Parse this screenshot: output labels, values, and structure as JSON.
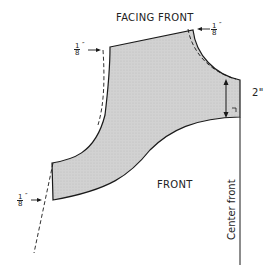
{
  "diagram": {
    "title": "FACING FRONT",
    "front_label": "FRONT",
    "center_front_label": "Center front",
    "measure_label": "2\"",
    "allowances": [
      {
        "num": "1",
        "den": "8",
        "unit": "″",
        "position": "top-left"
      },
      {
        "num": "1",
        "den": "8",
        "unit": "″",
        "position": "top-right"
      },
      {
        "num": "1",
        "den": "8",
        "unit": "″",
        "position": "bottom-left"
      }
    ],
    "colors": {
      "fill": "#cfcfcf",
      "line": "#1a1a1a",
      "background": "#ffffff"
    }
  }
}
